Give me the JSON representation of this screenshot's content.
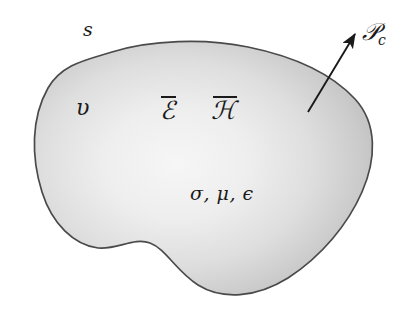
{
  "figure": {
    "background_color": "#ffffff",
    "outline_color": "#4a4a4a",
    "fill_center_color": "#f4f4f4",
    "fill_edge_color": "#c0c0c0",
    "width": 417,
    "height": 315
  },
  "labels": {
    "surface": "s",
    "volume": "υ",
    "electric_field": "ℰ",
    "magnetic_field": "ℋ",
    "material_params": "σ, μ, ϵ",
    "power_symbol": "𝒫",
    "power_subscript": "c"
  },
  "arrow": {
    "start_x": 308,
    "start_y": 112,
    "end_x": 357,
    "end_y": 31,
    "color": "#1a1a1a"
  }
}
